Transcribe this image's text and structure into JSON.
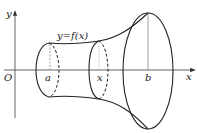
{
  "figure": {
    "axes": {
      "x_label": "x",
      "y_label": "y",
      "origin_label": "O"
    },
    "labels": {
      "curve": "y=f(x)",
      "a": "a",
      "x": "x",
      "b": "b"
    },
    "colors": {
      "stroke": "#222222",
      "axis": "#555555",
      "background": "#ffffff"
    }
  }
}
